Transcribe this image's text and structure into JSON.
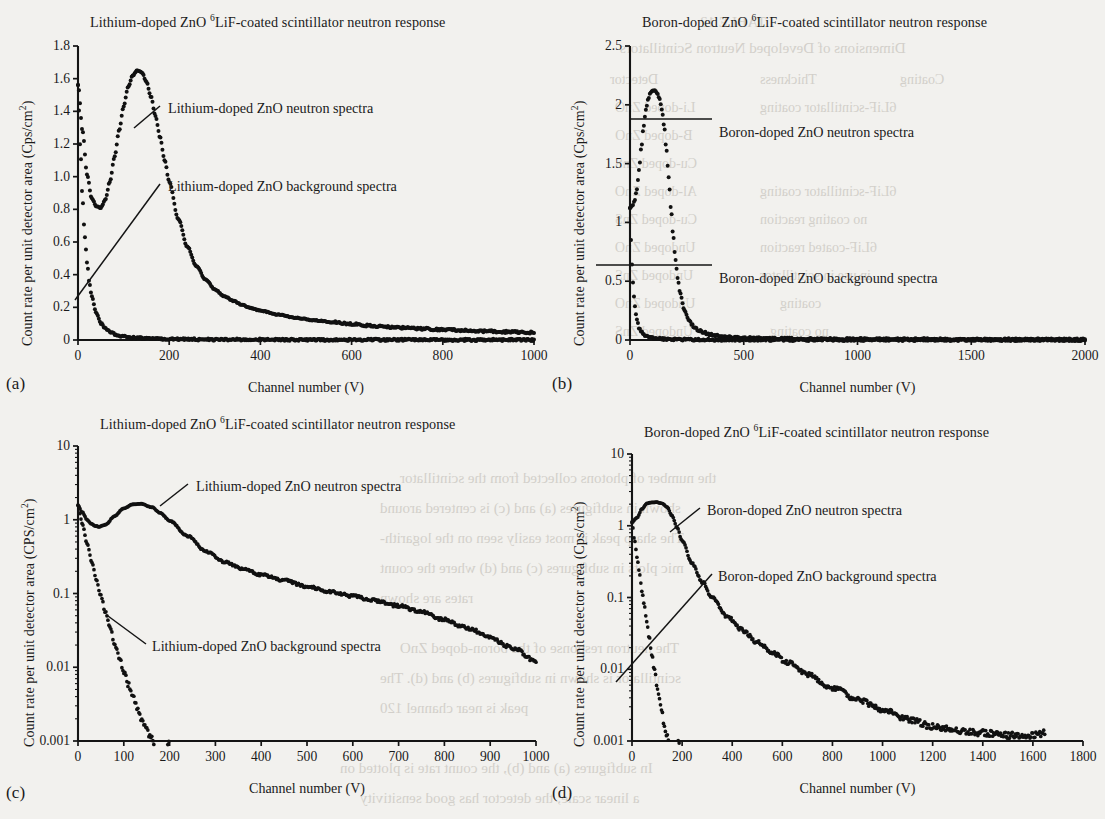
{
  "figure": {
    "axis_title_x": "Channel number (V)",
    "panels": [
      {
        "key": "a",
        "label": "(a)",
        "title_pre": "Lithium-doped ZnO ",
        "title_sup": "6",
        "title_post": "LiF-coated scintillator neutron response",
        "ylabel_pre": "Count rate per unit detector area (Cps/cm",
        "ylabel_sup": "2",
        "ylabel_post": ")",
        "xlabel": "Channel number (V)",
        "ann_neutron": "Lithium-doped ZnO neutron spectra",
        "ann_background": "Lithium-doped ZnO background spectra"
      },
      {
        "key": "b",
        "label": "(b)",
        "title_pre": "Boron-doped ZnO ",
        "title_sup": "6",
        "title_post": "LiF-coated scintillator neutron response",
        "ylabel_pre": "Count rate per unit detector area (Cps/cm",
        "ylabel_sup": "2",
        "ylabel_post": ")",
        "xlabel": "Channel number (V)",
        "ann_neutron": "Boron-doped ZnO neutron spectra",
        "ann_background": "Boron-doped ZnO background spectra"
      },
      {
        "key": "c",
        "label": "(c)",
        "title_pre": "Lithium-doped ZnO ",
        "title_sup": "6",
        "title_post": "LiF-coated scintillator neutron response",
        "ylabel_pre": "Count rate per unit detector area (CPS/cm",
        "ylabel_sup": "2",
        "ylabel_post": ")",
        "xlabel": "Channel number (V)",
        "ann_neutron": "Lithium-doped ZnO neutron spectra",
        "ann_background": "Lithium-doped ZnO background spectra"
      },
      {
        "key": "d",
        "label": "(d)",
        "title_pre": "Boron-doped ZnO ",
        "title_sup": "6",
        "title_post": "LiF-coated scintillator neutron response",
        "ylabel_pre": "Count rate per unit detector area (Cps/cm",
        "ylabel_sup": "2",
        "ylabel_post": ")",
        "xlabel": "Channel number (V)",
        "ann_neutron": "Boron-doped ZnO neutron spectra",
        "ann_background": "Boron-doped ZnO background spectra"
      }
    ]
  },
  "bleed_text": [
    {
      "t": "TABLE 12",
      "x": 700,
      "y": 14,
      "size": 15
    },
    {
      "t": "Dimensions of Developed Neutron Scintillators",
      "x": 620,
      "y": 40,
      "size": 15
    },
    {
      "t": "Detector",
      "x": 610,
      "y": 72,
      "size": 14
    },
    {
      "t": "Thickness",
      "x": 760,
      "y": 72,
      "size": 14
    },
    {
      "t": "Coating",
      "x": 900,
      "y": 72,
      "size": 14
    },
    {
      "t": "Li-doped ZnO",
      "x": 615,
      "y": 100,
      "size": 14
    },
    {
      "t": "6LiF-scintillator coating",
      "x": 760,
      "y": 100,
      "size": 14
    },
    {
      "t": "B-doped ZnO",
      "x": 615,
      "y": 128,
      "size": 14
    },
    {
      "t": "Cu-doped ZnS",
      "x": 615,
      "y": 156,
      "size": 14
    },
    {
      "t": "Al-doped ZnO",
      "x": 615,
      "y": 184,
      "size": 14
    },
    {
      "t": "6LiF-scintillator coating",
      "x": 760,
      "y": 184,
      "size": 14
    },
    {
      "t": "Cu-doped ZnS",
      "x": 615,
      "y": 212,
      "size": 14
    },
    {
      "t": "no coating reaction",
      "x": 760,
      "y": 212,
      "size": 14
    },
    {
      "t": "Undoped ZnO",
      "x": 615,
      "y": 240,
      "size": 14
    },
    {
      "t": "6LiF-coated reaction",
      "x": 760,
      "y": 240,
      "size": 14
    },
    {
      "t": "Undoped ZnS",
      "x": 615,
      "y": 268,
      "size": 14
    },
    {
      "t": "in use in scintillator",
      "x": 760,
      "y": 268,
      "size": 14
    },
    {
      "t": "Undoped ZnO",
      "x": 615,
      "y": 296,
      "size": 14
    },
    {
      "t": "coating",
      "x": 780,
      "y": 296,
      "size": 14
    },
    {
      "t": "Undoped ZnS",
      "x": 615,
      "y": 324,
      "size": 14
    },
    {
      "t": "no coating",
      "x": 770,
      "y": 324,
      "size": 14
    },
    {
      "t": "the number of photons collected from the scintillator",
      "x": 400,
      "y": 470,
      "size": 15
    },
    {
      "t": "shown in subfigures (a) and (c) is centered around",
      "x": 380,
      "y": 500,
      "size": 15
    },
    {
      "t": "The sharp peak is most easily seen on the logarith-",
      "x": 380,
      "y": 530,
      "size": 15
    },
    {
      "t": "mic plots in subfigures (c) and (d) where the count",
      "x": 380,
      "y": 560,
      "size": 15
    },
    {
      "t": "rates are shown",
      "x": 380,
      "y": 590,
      "size": 15
    },
    {
      "t": "The neutron response of the boron-doped ZnO",
      "x": 400,
      "y": 640,
      "size": 15
    },
    {
      "t": "scintillator is shown in subfigures (b) and (d). The",
      "x": 380,
      "y": 670,
      "size": 15
    },
    {
      "t": "peak is near channel 120",
      "x": 380,
      "y": 700,
      "size": 15
    },
    {
      "t": "In subfigures (a) and (b), the count rate is plotted on",
      "x": 340,
      "y": 760,
      "size": 15
    },
    {
      "t": "a linear scale; the detector has good sensitivity",
      "x": 360,
      "y": 790,
      "size": 15
    }
  ],
  "chart_data": [
    {
      "type": "line",
      "panel": "a",
      "title": "Lithium-doped ZnO 6LiF-coated scintillator neutron response",
      "xlabel": "Channel number (V)",
      "ylabel": "Count rate per unit detector area (Cps/cm2)",
      "yscale": "linear",
      "xlim": [
        0,
        1000
      ],
      "ylim": [
        0,
        1.8
      ],
      "xticks": [
        0,
        200,
        400,
        600,
        800,
        1000
      ],
      "yticks": [
        0,
        0.2,
        0.4,
        0.6,
        0.8,
        1.0,
        1.2,
        1.4,
        1.6,
        1.8
      ],
      "ytick_labels": [
        "0",
        "0.2",
        "0.4",
        "0.6",
        "0.8",
        "1.0",
        "1.2",
        "1.4",
        "1.6",
        "1.8"
      ],
      "grid": false,
      "series": [
        {
          "name": "Lithium-doped ZnO neutron spectra",
          "x": [
            0,
            10,
            20,
            30,
            40,
            50,
            60,
            70,
            80,
            90,
            100,
            110,
            120,
            130,
            140,
            150,
            160,
            170,
            180,
            190,
            200,
            220,
            240,
            260,
            280,
            300,
            320,
            340,
            360,
            380,
            400,
            440,
            480,
            520,
            560,
            600,
            650,
            700,
            750,
            800,
            850,
            900,
            950,
            1000
          ],
          "y": [
            1.56,
            1.28,
            1.01,
            0.87,
            0.82,
            0.81,
            0.86,
            0.97,
            1.12,
            1.28,
            1.43,
            1.55,
            1.62,
            1.65,
            1.64,
            1.58,
            1.49,
            1.37,
            1.24,
            1.1,
            0.97,
            0.74,
            0.57,
            0.45,
            0.37,
            0.31,
            0.27,
            0.24,
            0.215,
            0.195,
            0.18,
            0.155,
            0.135,
            0.12,
            0.108,
            0.098,
            0.086,
            0.077,
            0.07,
            0.063,
            0.058,
            0.053,
            0.049,
            0.046
          ]
        },
        {
          "name": "Lithium-doped ZnO background spectra",
          "x": [
            0,
            5,
            10,
            15,
            20,
            25,
            30,
            40,
            50,
            60,
            70,
            80,
            90,
            100,
            120,
            140,
            160,
            180,
            200,
            250,
            300,
            400,
            500,
            600,
            800,
            1000
          ],
          "y": [
            1.56,
            1.18,
            0.86,
            0.63,
            0.47,
            0.35,
            0.27,
            0.165,
            0.105,
            0.07,
            0.05,
            0.037,
            0.028,
            0.022,
            0.015,
            0.011,
            0.009,
            0.007,
            0.006,
            0.004,
            0.003,
            0.002,
            0.0015,
            0.001,
            0.0008,
            0.0006
          ]
        }
      ]
    },
    {
      "type": "line",
      "panel": "b",
      "title": "Boron-doped ZnO 6LiF-coated scintillator neutron response",
      "xlabel": "Channel number (V)",
      "ylabel": "Count rate per unit detector area (Cps/cm2)",
      "yscale": "linear",
      "xlim": [
        0,
        2000
      ],
      "ylim": [
        0,
        2.5
      ],
      "xticks": [
        0,
        500,
        1000,
        1500,
        2000
      ],
      "yticks": [
        0,
        0.5,
        1,
        1.5,
        2,
        2.5
      ],
      "ytick_labels": [
        "0",
        "0.5",
        "1",
        "1.5",
        "2",
        "2.5"
      ],
      "grid": false,
      "series": [
        {
          "name": "Boron-doped ZnO neutron spectra",
          "x": [
            0,
            10,
            20,
            30,
            40,
            50,
            60,
            70,
            80,
            90,
            100,
            110,
            120,
            130,
            140,
            150,
            160,
            170,
            180,
            190,
            200,
            210,
            220,
            240,
            260,
            280,
            300,
            320,
            350,
            380,
            400,
            450,
            500,
            560,
            620,
            700,
            800,
            900,
            1000,
            1200,
            1400,
            1600,
            1800,
            2000
          ],
          "y": [
            1.12,
            1.14,
            1.18,
            1.28,
            1.45,
            1.64,
            1.82,
            1.96,
            2.05,
            2.1,
            2.12,
            2.12,
            2.1,
            2.05,
            1.96,
            1.82,
            1.62,
            1.38,
            1.12,
            0.88,
            0.68,
            0.52,
            0.4,
            0.25,
            0.165,
            0.115,
            0.085,
            0.066,
            0.048,
            0.038,
            0.033,
            0.024,
            0.019,
            0.015,
            0.013,
            0.011,
            0.009,
            0.008,
            0.007,
            0.006,
            0.005,
            0.005,
            0.004,
            0.004
          ]
        },
        {
          "name": "Boron-doped ZnO background spectra",
          "x": [
            0,
            5,
            10,
            15,
            20,
            25,
            30,
            40,
            50,
            60,
            70,
            80,
            90,
            100,
            120,
            140,
            160,
            180,
            200,
            250,
            300,
            400,
            600,
            900,
            1200,
            1600,
            2000
          ],
          "y": [
            1.12,
            0.84,
            0.6,
            0.43,
            0.31,
            0.23,
            0.175,
            0.105,
            0.066,
            0.044,
            0.031,
            0.023,
            0.018,
            0.015,
            0.011,
            0.008,
            0.007,
            0.006,
            0.005,
            0.004,
            0.003,
            0.002,
            0.0015,
            0.001,
            0.0008,
            0.0006,
            0.0005
          ]
        }
      ]
    },
    {
      "type": "line",
      "panel": "c",
      "title": "Lithium-doped ZnO 6LiF-coated scintillator neutron response",
      "xlabel": "Channel number (V)",
      "ylabel": "Count rate per unit detector area (CPS/cm2)",
      "yscale": "log",
      "xlim": [
        0,
        1000
      ],
      "ylim": [
        0.001,
        10
      ],
      "xticks": [
        0,
        100,
        200,
        300,
        400,
        500,
        600,
        700,
        800,
        900,
        1000
      ],
      "yticks": [
        0.001,
        0.01,
        0.1,
        1,
        10
      ],
      "ytick_labels": [
        "0.001",
        "0.01",
        "0.1",
        "1",
        "10"
      ],
      "grid": false,
      "series": [
        {
          "name": "Lithium-doped ZnO neutron spectra",
          "x": [
            0,
            10,
            20,
            30,
            40,
            50,
            60,
            80,
            100,
            120,
            140,
            160,
            180,
            200,
            240,
            280,
            320,
            360,
            400,
            450,
            500,
            550,
            600,
            650,
            700,
            750,
            800,
            850,
            900,
            950,
            1000
          ],
          "y": [
            1.56,
            1.25,
            1.0,
            0.87,
            0.82,
            0.81,
            0.86,
            1.12,
            1.43,
            1.62,
            1.64,
            1.49,
            1.24,
            0.97,
            0.6,
            0.37,
            0.27,
            0.215,
            0.18,
            0.15,
            0.125,
            0.106,
            0.092,
            0.08,
            0.068,
            0.056,
            0.044,
            0.034,
            0.025,
            0.018,
            0.012
          ]
        },
        {
          "name": "Lithium-doped ZnO background spectra",
          "x": [
            0,
            10,
            20,
            30,
            40,
            50,
            60,
            70,
            80,
            90,
            100,
            110,
            120,
            130,
            140,
            150,
            160,
            170,
            180,
            190,
            200
          ],
          "y": [
            1.56,
            0.86,
            0.47,
            0.27,
            0.155,
            0.092,
            0.055,
            0.034,
            0.021,
            0.0135,
            0.0088,
            0.0058,
            0.0039,
            0.0027,
            0.0019,
            0.0014,
            0.00108,
            0.0009,
            0.00085,
            0.00092,
            0.001
          ]
        }
      ]
    },
    {
      "type": "line",
      "panel": "d",
      "title": "Boron-doped ZnO 6LiF-coated scintillator neutron response",
      "xlabel": "Channel number (V)",
      "ylabel": "Count rate per unit detector area (Cps/cm2)",
      "yscale": "log",
      "xlim": [
        0,
        1800
      ],
      "ylim": [
        0.001,
        10
      ],
      "xticks": [
        0,
        200,
        400,
        600,
        800,
        1000,
        1200,
        1400,
        1600,
        1800
      ],
      "yticks": [
        0.001,
        0.01,
        0.1,
        1,
        10
      ],
      "ytick_labels": [
        "0.001",
        "0.01",
        "0.1",
        "1",
        "10"
      ],
      "grid": false,
      "series": [
        {
          "name": "Boron-doped ZnO neutron spectra",
          "x": [
            0,
            20,
            40,
            60,
            80,
            100,
            120,
            140,
            160,
            180,
            200,
            240,
            280,
            320,
            380,
            440,
            500,
            560,
            620,
            700,
            800,
            900,
            1000,
            1100,
            1200,
            1300,
            1400,
            1500,
            1600,
            1650
          ],
          "y": [
            1.12,
            1.3,
            1.72,
            2.05,
            2.12,
            2.12,
            2.05,
            1.82,
            1.38,
            0.95,
            0.62,
            0.3,
            0.165,
            0.1,
            0.055,
            0.035,
            0.024,
            0.017,
            0.0125,
            0.0085,
            0.0055,
            0.0038,
            0.0027,
            0.002,
            0.0016,
            0.0014,
            0.0013,
            0.0012,
            0.0012,
            0.0013
          ]
        },
        {
          "name": "Boron-doped ZnO background spectra",
          "x": [
            0,
            10,
            20,
            30,
            40,
            50,
            60,
            70,
            80,
            90,
            100,
            110,
            120,
            130,
            140,
            150,
            160,
            170,
            180,
            190
          ],
          "y": [
            1.12,
            0.63,
            0.37,
            0.215,
            0.125,
            0.073,
            0.043,
            0.026,
            0.0155,
            0.0095,
            0.0058,
            0.0037,
            0.0024,
            0.0016,
            0.00115,
            0.0009,
            0.0008,
            0.00082,
            0.00092,
            0.001
          ]
        }
      ]
    }
  ]
}
